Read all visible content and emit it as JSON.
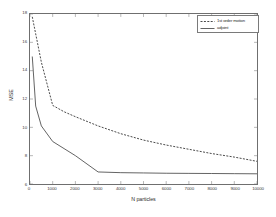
{
  "chart_data": {
    "type": "line",
    "title": "",
    "xlabel": "N particles",
    "ylabel": "MSE",
    "xlim": [
      0,
      10000
    ],
    "ylim": [
      6,
      18
    ],
    "grid": false,
    "legend_position": "top-right",
    "xticks": [
      0,
      1000,
      2000,
      3000,
      4000,
      5000,
      6000,
      7000,
      8000,
      9000,
      10000
    ],
    "xticklabels": [
      "0",
      "1000",
      "2000",
      "3000",
      "4000",
      "5000",
      "6000",
      "7000",
      "8000",
      "9000",
      "10000"
    ],
    "yticks": [
      6,
      8,
      10,
      12,
      14,
      16,
      18
    ],
    "yticklabels": [
      "6",
      "8",
      "10",
      "12",
      "14",
      "16",
      "18"
    ],
    "series": [
      {
        "name": "1st order motion",
        "style": "dashed",
        "color": "#1a1a1a",
        "x": [
          100,
          250,
          500,
          1000,
          1500,
          2000,
          3000,
          4000,
          5000,
          6000,
          7000,
          8000,
          9000,
          10000
        ],
        "y": [
          17.8,
          16.6,
          14.6,
          11.55,
          11.1,
          10.75,
          10.1,
          9.55,
          9.1,
          8.75,
          8.45,
          8.15,
          7.9,
          7.6
        ]
      },
      {
        "name": "adjoint",
        "style": "solid",
        "color": "#3a3a3a",
        "x": [
          100,
          250,
          500,
          1000,
          1500,
          2000,
          3000,
          4000,
          5000,
          6000,
          7000,
          8000,
          9000,
          10000
        ],
        "y": [
          15.0,
          11.5,
          10.1,
          9.0,
          8.5,
          8.0,
          6.85,
          6.8,
          6.78,
          6.76,
          6.75,
          6.74,
          6.73,
          6.72
        ]
      }
    ]
  },
  "legend": {
    "entries": [
      {
        "label": "1st order motion"
      },
      {
        "label": "adjoint"
      }
    ]
  }
}
